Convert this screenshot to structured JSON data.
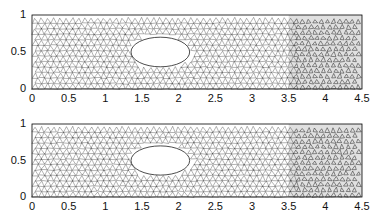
{
  "figure": {
    "panels": [
      {
        "name": "top",
        "x_ticks": [
          "0",
          "0.5",
          "1",
          "1.5",
          "2",
          "2.5",
          "3",
          "3.5",
          "4",
          "4.5"
        ],
        "y_ticks": [
          "0",
          "0.5",
          "1"
        ]
      },
      {
        "name": "bottom",
        "x_ticks": [
          "0",
          "0.5",
          "1",
          "1.5",
          "2",
          "2.5",
          "3",
          "3.5",
          "4",
          "4.5"
        ],
        "y_ticks": [
          "0",
          "0.5",
          "1"
        ]
      }
    ],
    "domain": {
      "xlim": [
        0,
        4.5
      ],
      "ylim": [
        0,
        1
      ],
      "hole_center": [
        1.75,
        0.5
      ],
      "hole_radii": [
        0.4,
        0.2
      ],
      "dense_region_x": [
        3.5,
        4.5
      ]
    },
    "colors": {
      "mesh": "#222222",
      "dense": "#555555",
      "bg": "#ffffff"
    }
  }
}
